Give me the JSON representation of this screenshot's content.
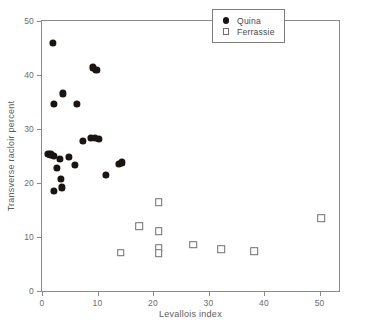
{
  "chart_data": {
    "type": "scatter",
    "title": "",
    "xlabel": "Levallois index",
    "ylabel": "Transverse racloir percent",
    "xlim": [
      0,
      53.5
    ],
    "ylim": [
      0,
      50
    ],
    "xticks": [
      0,
      10,
      20,
      30,
      40,
      50
    ],
    "yticks": [
      0,
      10,
      20,
      30,
      40,
      50
    ],
    "xticklabels": [
      "0",
      "10",
      "20",
      "30",
      "40",
      "50"
    ],
    "yticklabels": [
      "0",
      "10",
      "20",
      "30",
      "40",
      "50"
    ],
    "grid": false,
    "legend_position": "top-right",
    "series": [
      {
        "name": "Quina",
        "marker": "filled-circle",
        "color": "#1b1512",
        "points": [
          [
            2.0,
            46.0
          ],
          [
            9.2,
            41.4
          ],
          [
            9.8,
            41.0
          ],
          [
            3.8,
            36.6
          ],
          [
            2.2,
            34.7
          ],
          [
            6.3,
            34.6
          ],
          [
            7.3,
            27.8
          ],
          [
            8.8,
            28.3
          ],
          [
            9.6,
            28.4
          ],
          [
            10.2,
            28.1
          ],
          [
            1.0,
            25.4
          ],
          [
            1.5,
            25.3
          ],
          [
            2.1,
            25.0
          ],
          [
            3.2,
            24.5
          ],
          [
            4.8,
            24.8
          ],
          [
            5.9,
            23.4
          ],
          [
            2.7,
            22.8
          ],
          [
            13.8,
            23.5
          ],
          [
            14.4,
            23.8
          ],
          [
            11.5,
            21.5
          ],
          [
            3.4,
            20.8
          ],
          [
            2.2,
            18.5
          ],
          [
            3.6,
            19.2
          ]
        ]
      },
      {
        "name": "Ferrassie",
        "marker": "open-square",
        "color": "#6f6f6f",
        "points": [
          [
            21.0,
            16.4
          ],
          [
            50.3,
            13.5
          ],
          [
            17.5,
            12.0
          ],
          [
            21.0,
            11.1
          ],
          [
            27.2,
            8.6
          ],
          [
            32.3,
            7.7
          ],
          [
            21.0,
            7.9
          ],
          [
            21.0,
            7.0
          ],
          [
            14.2,
            7.1
          ],
          [
            38.2,
            7.4
          ]
        ]
      }
    ]
  },
  "legend": {
    "items": [
      {
        "label": "Quina",
        "marker": "filled-circle"
      },
      {
        "label": "Ferrassie",
        "marker": "open-square"
      }
    ]
  }
}
